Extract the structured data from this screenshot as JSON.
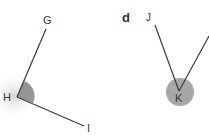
{
  "panel_c": {
    "points": {
      "G": "G",
      "H": "H",
      "I": "I"
    },
    "vertex": "H",
    "angle_type": "obtuse"
  },
  "panel_d": {
    "label": "d",
    "points": {
      "J": "J",
      "K": "K"
    },
    "vertex": "K",
    "angle_type": "acute"
  },
  "colors": {
    "line": "#3c3c3c",
    "angle_fill": "#8a8a8a",
    "glow": "#cfcfcf",
    "text": "#3a3a3a"
  }
}
